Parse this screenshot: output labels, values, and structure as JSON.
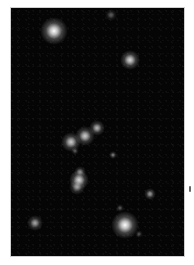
{
  "image": {
    "subject": "star field",
    "background_color": "#050505",
    "frame_border_color": "#cfcfcf",
    "stars": [
      {
        "x": 53,
        "y": 30,
        "r": 7,
        "brightness": 1.0
      },
      {
        "x": 110,
        "y": 14,
        "r": 3,
        "brightness": 0.35
      },
      {
        "x": 129,
        "y": 59,
        "r": 5,
        "brightness": 0.85
      },
      {
        "x": 96,
        "y": 127,
        "r": 4,
        "brightness": 0.7
      },
      {
        "x": 84,
        "y": 135,
        "r": 5,
        "brightness": 0.8
      },
      {
        "x": 70,
        "y": 141,
        "r": 5,
        "brightness": 0.8
      },
      {
        "x": 74,
        "y": 150,
        "r": 2,
        "brightness": 0.35
      },
      {
        "x": 112,
        "y": 154,
        "r": 2,
        "brightness": 0.5
      },
      {
        "x": 79,
        "y": 171,
        "r": 3,
        "brightness": 0.55
      },
      {
        "x": 78,
        "y": 179,
        "r": 5,
        "brightness": 0.85
      },
      {
        "x": 76,
        "y": 186,
        "r": 4,
        "brightness": 0.6
      },
      {
        "x": 149,
        "y": 193,
        "r": 3,
        "brightness": 0.6
      },
      {
        "x": 119,
        "y": 207,
        "r": 2,
        "brightness": 0.35
      },
      {
        "x": 34,
        "y": 222,
        "r": 4,
        "brightness": 0.65
      },
      {
        "x": 124,
        "y": 224,
        "r": 7,
        "brightness": 1.0
      },
      {
        "x": 138,
        "y": 233,
        "r": 2,
        "brightness": 0.3
      }
    ]
  }
}
